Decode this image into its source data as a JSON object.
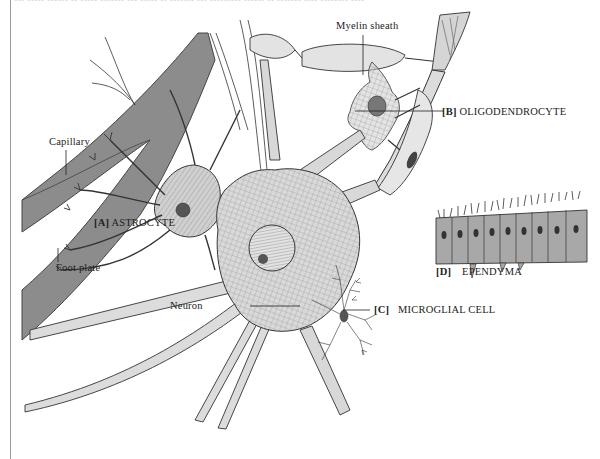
{
  "figure": {
    "top_caption_cut": "[D] Ependyma cells and processes of neuroglia ... (partially cut off)",
    "labels": {
      "myelin_sheath": "Myelin sheath",
      "capillary": "Capillary",
      "astrocyte_key": "[A]",
      "astrocyte": "ASTROCYTE",
      "foot_plate": "Foot plate",
      "oligodendrocyte_key": "[B]",
      "oligodendrocyte": "OLIGODENDROCYTE",
      "neuron": "Neuron",
      "microglial_key": "[C]",
      "microglial": "MICROGLIAL CELL",
      "ependyma_key": "[D]",
      "ependyma": "EPENDYMA"
    },
    "colors": {
      "capillary": "#8c8c8c",
      "cell_fill": "#d9d9d9",
      "outline": "#333333",
      "nucleus": "#555555"
    }
  }
}
